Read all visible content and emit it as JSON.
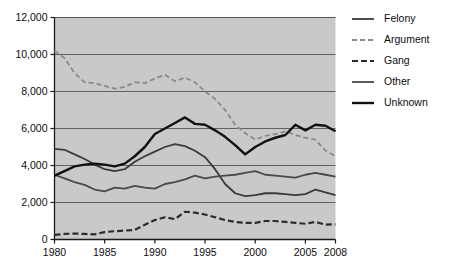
{
  "chart_data": {
    "type": "line",
    "title": "",
    "xlabel": "",
    "ylabel": "",
    "xlim": [
      1980,
      2008
    ],
    "ylim": [
      0,
      12000
    ],
    "grid": true,
    "legend_position": "right",
    "x": [
      1980,
      1981,
      1982,
      1983,
      1984,
      1985,
      1986,
      1987,
      1988,
      1989,
      1990,
      1991,
      1992,
      1993,
      1994,
      1995,
      1996,
      1997,
      1998,
      1999,
      2000,
      2001,
      2002,
      2003,
      2004,
      2005,
      2006,
      2007,
      2008
    ],
    "y_ticks": [
      0,
      2000,
      4000,
      6000,
      8000,
      10000,
      12000
    ],
    "y_tick_labels": [
      "0",
      "2,000",
      "4,000",
      "6,000",
      "8,000",
      "10,000",
      "12,000"
    ],
    "x_ticks": [
      1980,
      1985,
      1990,
      1995,
      2000,
      2005,
      2008
    ],
    "x_tick_labels": [
      "1980",
      "1985",
      "1990",
      "1995",
      "2000",
      "2005",
      "2008"
    ],
    "series": [
      {
        "name": "Felony",
        "style": "solid",
        "color": "#3a3a3a",
        "width": 1.8,
        "values": [
          4900,
          4850,
          4600,
          4350,
          4050,
          3800,
          3700,
          3800,
          4200,
          4500,
          4750,
          5000,
          5150,
          5050,
          4800,
          4450,
          3800,
          3000,
          2500,
          2350,
          2400,
          2500,
          2500,
          2450,
          2400,
          2450,
          2700,
          2550,
          2400
        ]
      },
      {
        "name": "Argument",
        "style": "dashed",
        "color": "#8a8a8a",
        "width": 1.8,
        "values": [
          10200,
          9800,
          9000,
          8500,
          8450,
          8300,
          8150,
          8250,
          8500,
          8450,
          8700,
          8900,
          8550,
          8750,
          8500,
          8000,
          7600,
          7000,
          6200,
          5750,
          5400,
          5600,
          5700,
          5850,
          5650,
          5500,
          5400,
          4800,
          4500
        ]
      },
      {
        "name": "Gang",
        "style": "dashed",
        "color": "#2b2b2b",
        "width": 2.2,
        "values": [
          250,
          300,
          320,
          300,
          280,
          400,
          450,
          480,
          520,
          800,
          1050,
          1200,
          1100,
          1500,
          1450,
          1350,
          1200,
          1050,
          950,
          900,
          900,
          1000,
          1000,
          950,
          900,
          850,
          950,
          800,
          820
        ]
      },
      {
        "name": "Other",
        "style": "solid",
        "color": "#4a4a4a",
        "width": 1.8,
        "values": [
          3500,
          3300,
          3100,
          2950,
          2700,
          2600,
          2800,
          2750,
          2900,
          2800,
          2750,
          3000,
          3100,
          3250,
          3450,
          3300,
          3400,
          3450,
          3500,
          3600,
          3700,
          3500,
          3450,
          3400,
          3350,
          3500,
          3600,
          3500,
          3400
        ]
      },
      {
        "name": "Unknown",
        "style": "solid",
        "color": "#111111",
        "width": 2.4,
        "values": [
          3450,
          3700,
          3950,
          4050,
          4100,
          4050,
          3950,
          4100,
          4500,
          5000,
          5700,
          6000,
          6300,
          6600,
          6250,
          6200,
          5900,
          5550,
          5100,
          4600,
          5000,
          5300,
          5500,
          5650,
          6200,
          5900,
          6200,
          6150,
          5850
        ]
      }
    ]
  },
  "axis": {
    "y_tick_labels": [
      "12,000",
      "10,000",
      "8,000",
      "6,000",
      "4,000",
      "2,000",
      "0"
    ],
    "x_tick_labels": [
      "1980",
      "1985",
      "1990",
      "1995",
      "2000",
      "2005",
      "2008"
    ]
  },
  "legend": {
    "items": [
      {
        "label": "Felony",
        "style": "solid",
        "color": "#3a3a3a"
      },
      {
        "label": "Argument",
        "style": "dashed",
        "color": "#8a8a8a"
      },
      {
        "label": "Gang",
        "style": "dashed",
        "color": "#2b2b2b"
      },
      {
        "label": "Other",
        "style": "solid",
        "color": "#4a4a4a"
      },
      {
        "label": "Unknown",
        "style": "solid",
        "color": "#111111"
      }
    ]
  },
  "colors": {
    "plot_background": "#c9c9c9",
    "gridline": "#555555",
    "axis": "#1a1a1a",
    "page_background": "#ffffff",
    "text": "#0d0d0d"
  }
}
